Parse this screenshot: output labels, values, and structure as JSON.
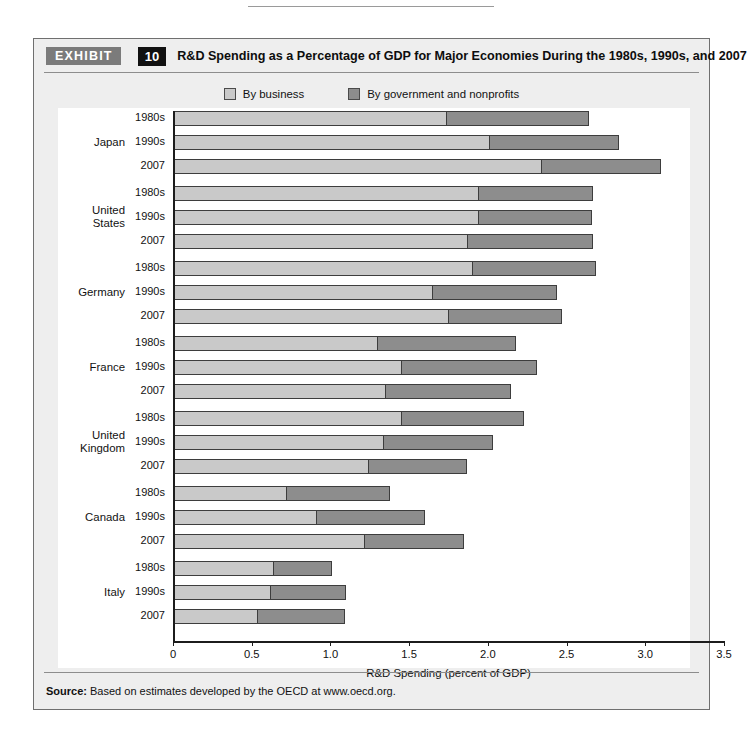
{
  "exhibit": {
    "tag": "EXHIBIT",
    "number": "10",
    "title": "R&D Spending as a Percentage of GDP for Major Economies During the 1980s, 1990s, and 2007"
  },
  "source": {
    "label": "Source:",
    "text": " Based on estimates developed by the OECD at www.oecd.org."
  },
  "colors": {
    "business": "#c9c9c9",
    "government": "#8d8d8d",
    "outline": "#3d3d3d",
    "panel": "#eeeeee",
    "plot": "#ffffff"
  },
  "chart_data": {
    "type": "bar",
    "orientation": "horizontal",
    "stacked": true,
    "title": "R&D Spending as a Percentage of GDP for Major Economies During the 1980s, 1990s, and 2007",
    "xlabel": "R&D Spending (percent of GDP)",
    "ylabel": "",
    "xlim": [
      0,
      3.5
    ],
    "xticks": [
      0,
      0.5,
      1.0,
      1.5,
      2.0,
      2.5,
      3.0,
      3.5
    ],
    "xtick_labels": [
      "0",
      "0.5",
      "1.0",
      "1.5",
      "2.0",
      "2.5",
      "3.0",
      "3.5"
    ],
    "grid": false,
    "legend_position": "top-center",
    "legend": [
      {
        "name": "By business",
        "color": "#c9c9c9"
      },
      {
        "name": "By government and nonprofits",
        "color": "#8d8d8d"
      }
    ],
    "series": [
      {
        "name": "By business",
        "color": "#c9c9c9"
      },
      {
        "name": "By government and nonprofits",
        "color": "#8d8d8d"
      }
    ],
    "groups": [
      {
        "country": "Japan",
        "rows": [
          {
            "period": "1980s",
            "business": 1.73,
            "government": 0.91,
            "total": 2.64
          },
          {
            "period": "1990s",
            "business": 2.0,
            "government": 0.83,
            "total": 2.83
          },
          {
            "period": "2007",
            "business": 2.33,
            "government": 0.77,
            "total": 3.1
          }
        ]
      },
      {
        "country": "United States",
        "country_lines": [
          "United",
          "States"
        ],
        "rows": [
          {
            "period": "1980s",
            "business": 1.93,
            "government": 0.74,
            "total": 2.67
          },
          {
            "period": "1990s",
            "business": 1.93,
            "government": 0.73,
            "total": 2.66
          },
          {
            "period": "2007",
            "business": 1.86,
            "government": 0.81,
            "total": 2.67
          }
        ]
      },
      {
        "country": "Germany",
        "rows": [
          {
            "period": "1980s",
            "business": 1.89,
            "government": 0.8,
            "total": 2.69
          },
          {
            "period": "1990s",
            "business": 1.64,
            "government": 0.8,
            "total": 2.44
          },
          {
            "period": "2007",
            "business": 1.74,
            "government": 0.73,
            "total": 2.47
          }
        ]
      },
      {
        "country": "France",
        "rows": [
          {
            "period": "1980s",
            "business": 1.29,
            "government": 0.89,
            "total": 2.18
          },
          {
            "period": "1990s",
            "business": 1.44,
            "government": 0.87,
            "total": 2.31
          },
          {
            "period": "2007",
            "business": 1.34,
            "government": 0.81,
            "total": 2.15
          }
        ]
      },
      {
        "country": "United Kingdom",
        "country_lines": [
          "United",
          "Kingdom"
        ],
        "rows": [
          {
            "period": "1980s",
            "business": 1.44,
            "government": 0.79,
            "total": 2.23
          },
          {
            "period": "1990s",
            "business": 1.33,
            "government": 0.7,
            "total": 2.03
          },
          {
            "period": "2007",
            "business": 1.23,
            "government": 0.64,
            "total": 1.87
          }
        ]
      },
      {
        "country": "Canada",
        "rows": [
          {
            "period": "1980s",
            "business": 0.71,
            "government": 0.67,
            "total": 1.38
          },
          {
            "period": "1990s",
            "business": 0.9,
            "government": 0.7,
            "total": 1.6
          },
          {
            "period": "2007",
            "business": 1.21,
            "government": 0.64,
            "total": 1.85
          }
        ]
      },
      {
        "country": "Italy",
        "rows": [
          {
            "period": "1980s",
            "business": 0.63,
            "government": 0.38,
            "total": 1.01
          },
          {
            "period": "1990s",
            "business": 0.61,
            "government": 0.49,
            "total": 1.1
          },
          {
            "period": "2007",
            "business": 0.53,
            "government": 0.56,
            "total": 1.09
          }
        ]
      }
    ]
  }
}
